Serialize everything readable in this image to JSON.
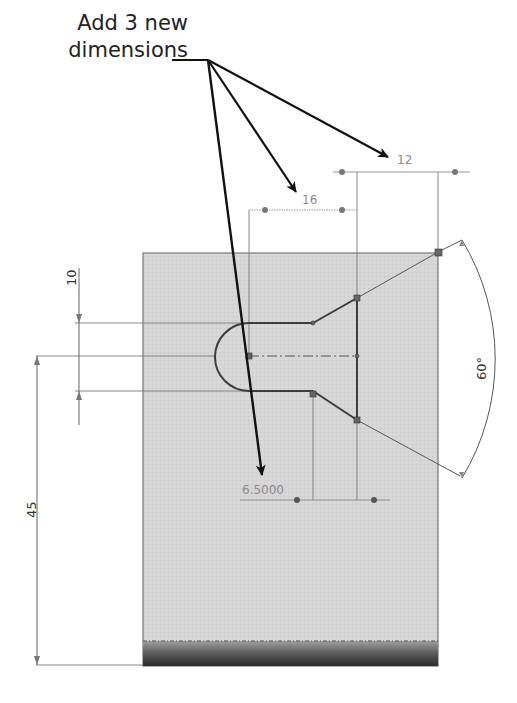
{
  "callout": {
    "line1": "Add 3 new",
    "line2": "dimensions",
    "arrow_count": 3
  },
  "sketch": {
    "part_fill": "#d4d4d4",
    "part_edge": "#555555",
    "sketch_line": "#444444",
    "dimension_color": "#8a8a8a"
  },
  "dimensions": {
    "new_16": "16",
    "new_12": "12",
    "new_6_5": "6.5000",
    "angle": "60°",
    "slot_width": "10",
    "height_45": "45"
  }
}
